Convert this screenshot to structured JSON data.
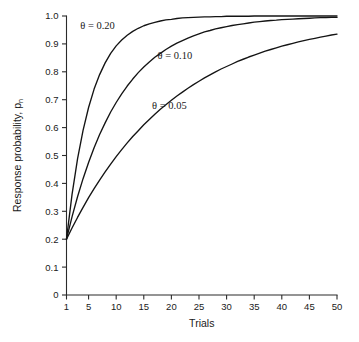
{
  "chart_data": {
    "type": "line",
    "title": "",
    "xlabel": "Trials",
    "ylabel": "Response probability, p",
    "ylabel_subscript": "n",
    "xlim": [
      1,
      50
    ],
    "ylim": [
      0,
      1.0
    ],
    "grid": false,
    "legend_position": "inline-annotations",
    "x_ticks": [
      "1",
      "5",
      "10",
      "15",
      "20",
      "25",
      "30",
      "35",
      "40",
      "45",
      "50"
    ],
    "x_tick_values": [
      1,
      5,
      10,
      15,
      20,
      25,
      30,
      35,
      40,
      45,
      50
    ],
    "y_ticks": [
      "0",
      "0.1",
      "0.2",
      "0.3",
      "0.4",
      "0.5",
      "0.6",
      "0.7",
      "0.8",
      "0.9",
      "1.0"
    ],
    "y_tick_values": [
      0,
      0.1,
      0.2,
      0.3,
      0.4,
      0.5,
      0.6,
      0.7,
      0.8,
      0.9,
      1.0
    ],
    "model": "p_n = 1 - (1 - p_1)(1 - theta)^(n-1)",
    "initial_probability": 0.2,
    "x": [
      1,
      2,
      3,
      4,
      5,
      6,
      7,
      8,
      9,
      10,
      11,
      12,
      13,
      14,
      15,
      16,
      17,
      18,
      19,
      20,
      21,
      22,
      23,
      24,
      25,
      26,
      27,
      28,
      29,
      30,
      31,
      32,
      33,
      34,
      35,
      36,
      37,
      38,
      39,
      40,
      41,
      42,
      43,
      44,
      45,
      46,
      47,
      48,
      49,
      50
    ],
    "series": [
      {
        "name": "theta = 0.20",
        "label": "θ = 0.20",
        "theta": 0.2,
        "color": "#141414",
        "values": [
          0.2,
          0.36,
          0.488,
          0.59,
          0.672,
          0.738,
          0.79,
          0.832,
          0.866,
          0.893,
          0.914,
          0.931,
          0.945,
          0.956,
          0.965,
          0.972,
          0.977,
          0.982,
          0.986,
          0.988,
          0.991,
          0.993,
          0.994,
          0.995,
          0.996,
          0.997,
          0.997,
          0.998,
          0.998,
          0.999,
          0.999,
          0.999,
          0.999,
          0.999,
          1.0,
          1.0,
          1.0,
          1.0,
          1.0,
          1.0,
          1.0,
          1.0,
          1.0,
          1.0,
          1.0,
          1.0,
          1.0,
          1.0,
          1.0,
          1.0
        ]
      },
      {
        "name": "theta = 0.10",
        "label": "θ = 0.10",
        "theta": 0.1,
        "color": "#141414",
        "values": [
          0.2,
          0.28,
          0.352,
          0.417,
          0.475,
          0.528,
          0.575,
          0.617,
          0.656,
          0.69,
          0.721,
          0.749,
          0.774,
          0.797,
          0.817,
          0.835,
          0.852,
          0.866,
          0.88,
          0.892,
          0.903,
          0.912,
          0.921,
          0.929,
          0.936,
          0.943,
          0.948,
          0.954,
          0.958,
          0.962,
          0.966,
          0.969,
          0.972,
          0.975,
          0.978,
          0.98,
          0.982,
          0.984,
          0.985,
          0.987,
          0.988,
          0.989,
          0.99,
          0.991,
          0.992,
          0.993,
          0.994,
          0.994,
          0.995,
          0.995
        ]
      },
      {
        "name": "theta = 0.05",
        "label": "θ = 0.05",
        "theta": 0.05,
        "color": "#141414",
        "values": [
          0.2,
          0.24,
          0.278,
          0.314,
          0.349,
          0.381,
          0.412,
          0.441,
          0.469,
          0.496,
          0.521,
          0.545,
          0.568,
          0.589,
          0.61,
          0.629,
          0.648,
          0.666,
          0.682,
          0.698,
          0.713,
          0.727,
          0.741,
          0.754,
          0.766,
          0.778,
          0.789,
          0.8,
          0.81,
          0.819,
          0.828,
          0.837,
          0.845,
          0.853,
          0.86,
          0.867,
          0.874,
          0.88,
          0.886,
          0.892,
          0.897,
          0.902,
          0.907,
          0.912,
          0.916,
          0.92,
          0.924,
          0.928,
          0.932,
          0.935
        ]
      }
    ],
    "annotations": [
      {
        "text": "θ = 0.20",
        "x": 3.5,
        "y": 0.955
      },
      {
        "text": "θ = 0.10",
        "x": 17.5,
        "y": 0.845
      },
      {
        "text": "θ = 0.05",
        "x": 16.5,
        "y": 0.665
      }
    ]
  }
}
